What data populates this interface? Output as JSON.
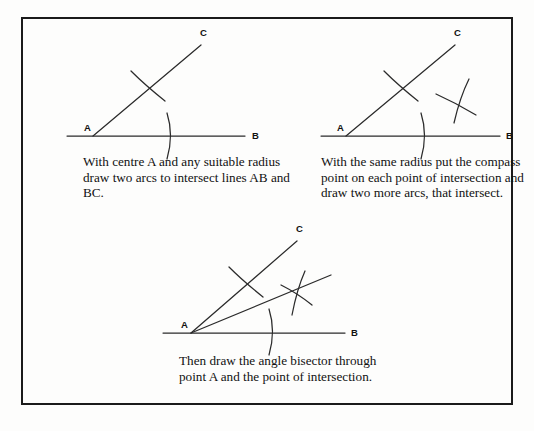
{
  "page": {
    "background_color": "#fdfdfc",
    "frame_color": "#1b1b1b",
    "ink_color": "#2b2b2b",
    "bleed_top": "",
    "bleed_bottom": ""
  },
  "panels": [
    {
      "id": "panel-1",
      "name": "step-1-draw-two-arcs",
      "caption": "With centre A and any suitable radius draw two arcs to intersect lines AB and BC.",
      "labels": {
        "a": "A",
        "b": "B",
        "c": "C"
      },
      "geometry": {
        "vertex_a": [
          46,
          113
        ],
        "point_b": [
          200,
          113
        ],
        "point_c": [
          152,
          18
        ],
        "arc_on_ac": "crossing tick across ray AC",
        "arc_on_ab": "crossing tick across ray AB",
        "ray_ac_angle_deg": 31.7
      }
    },
    {
      "id": "panel-2",
      "name": "step-2-draw-two-more-arcs",
      "caption": "With the same radius put the compass point on each point of intersection and draw two more arcs, that intersect.",
      "labels": {
        "a": "A",
        "b": "B",
        "c": "C"
      },
      "geometry": {
        "vertex_a": [
          41,
          113
        ],
        "point_b": [
          197,
          113
        ],
        "point_c": [
          148,
          18
        ],
        "arcs": "two further arcs crossing to the right of ray AC",
        "ray_ac_angle_deg": 31.3
      }
    },
    {
      "id": "panel-3",
      "name": "step-3-draw-angle-bisector",
      "caption": "Then draw the angle bisector through point A and the point of intersection.",
      "labels": {
        "a": "A",
        "b": "B",
        "c": "C"
      },
      "geometry": {
        "vertex_a": [
          46,
          110
        ],
        "point_b": [
          205,
          110
        ],
        "point_c": [
          150,
          14
        ],
        "bisector_through": "A and arc intersection point",
        "bisector_angle_deg": 16.5
      }
    }
  ]
}
